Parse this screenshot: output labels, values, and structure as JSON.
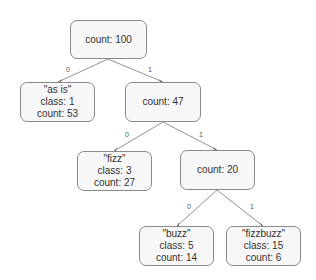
{
  "diagram": {
    "type": "decision-tree",
    "nodes": {
      "root": {
        "lines": [
          "count: 100"
        ]
      },
      "n_asis": {
        "lines": [
          "\"as is\"",
          "class: 1",
          "count: 53"
        ]
      },
      "n47": {
        "lines": [
          "count: 47"
        ]
      },
      "n_fizz": {
        "lines": [
          "\"fizz\"",
          "class: 3",
          "count: 27"
        ]
      },
      "n20": {
        "lines": [
          "count: 20"
        ]
      },
      "n_buzz": {
        "lines": [
          "\"buzz\"",
          "class: 5",
          "count: 14"
        ]
      },
      "n_fizzbuzz": {
        "lines": [
          "\"fizzbuzz\"",
          "class: 15",
          "count: 6"
        ]
      }
    },
    "edges": [
      {
        "from": "root",
        "to": "n_asis",
        "label": "0"
      },
      {
        "from": "root",
        "to": "n47",
        "label": "1"
      },
      {
        "from": "n47",
        "to": "n_fizz",
        "label": "0"
      },
      {
        "from": "n47",
        "to": "n20",
        "label": "1"
      },
      {
        "from": "n20",
        "to": "n_buzz",
        "label": "0"
      },
      {
        "from": "n20",
        "to": "n_fizzbuzz",
        "label": "1"
      }
    ]
  }
}
